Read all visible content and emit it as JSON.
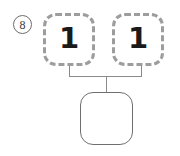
{
  "worksheet": {
    "problem_number": "8",
    "diagram_type": "number-bond",
    "colors": {
      "background": "#ffffff",
      "part_box_border": "#9d9d9d",
      "whole_box_border": "#6f6f6f",
      "connector": "#8a8a8a",
      "digit": "#1a1a1a",
      "problem_number_text": "#3a3a3a"
    }
  },
  "number_bond": {
    "parts": [
      {
        "label": "left-part",
        "value": "1",
        "border_style": "dashed",
        "filled": true
      },
      {
        "label": "right-part",
        "value": "1",
        "border_style": "dashed",
        "filled": true
      }
    ],
    "whole": {
      "label": "whole",
      "value": "",
      "border_style": "solid",
      "filled": false
    }
  }
}
